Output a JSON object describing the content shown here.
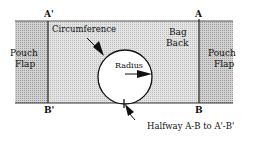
{
  "diagram": {
    "points": {
      "a_prime": "A'",
      "a": "A",
      "b_prime": "B'",
      "b": "B"
    },
    "regions": {
      "left_flap_line1": "Pouch",
      "left_flap_line2": "Flap",
      "right_flap_line1": "Pouch",
      "right_flap_line2": "Flap",
      "bag_back_line1": "Bag",
      "bag_back_line2": "Back"
    },
    "labels": {
      "circumference": "Circumference",
      "radius": "Radius",
      "halfway": "Halfway A-B to A'-B'"
    },
    "colors": {
      "flap_fill": "#c9c9c9",
      "back_fill": "#dedede",
      "stroke": "#1a1a1a",
      "circle_fill": "#ffffff"
    }
  }
}
